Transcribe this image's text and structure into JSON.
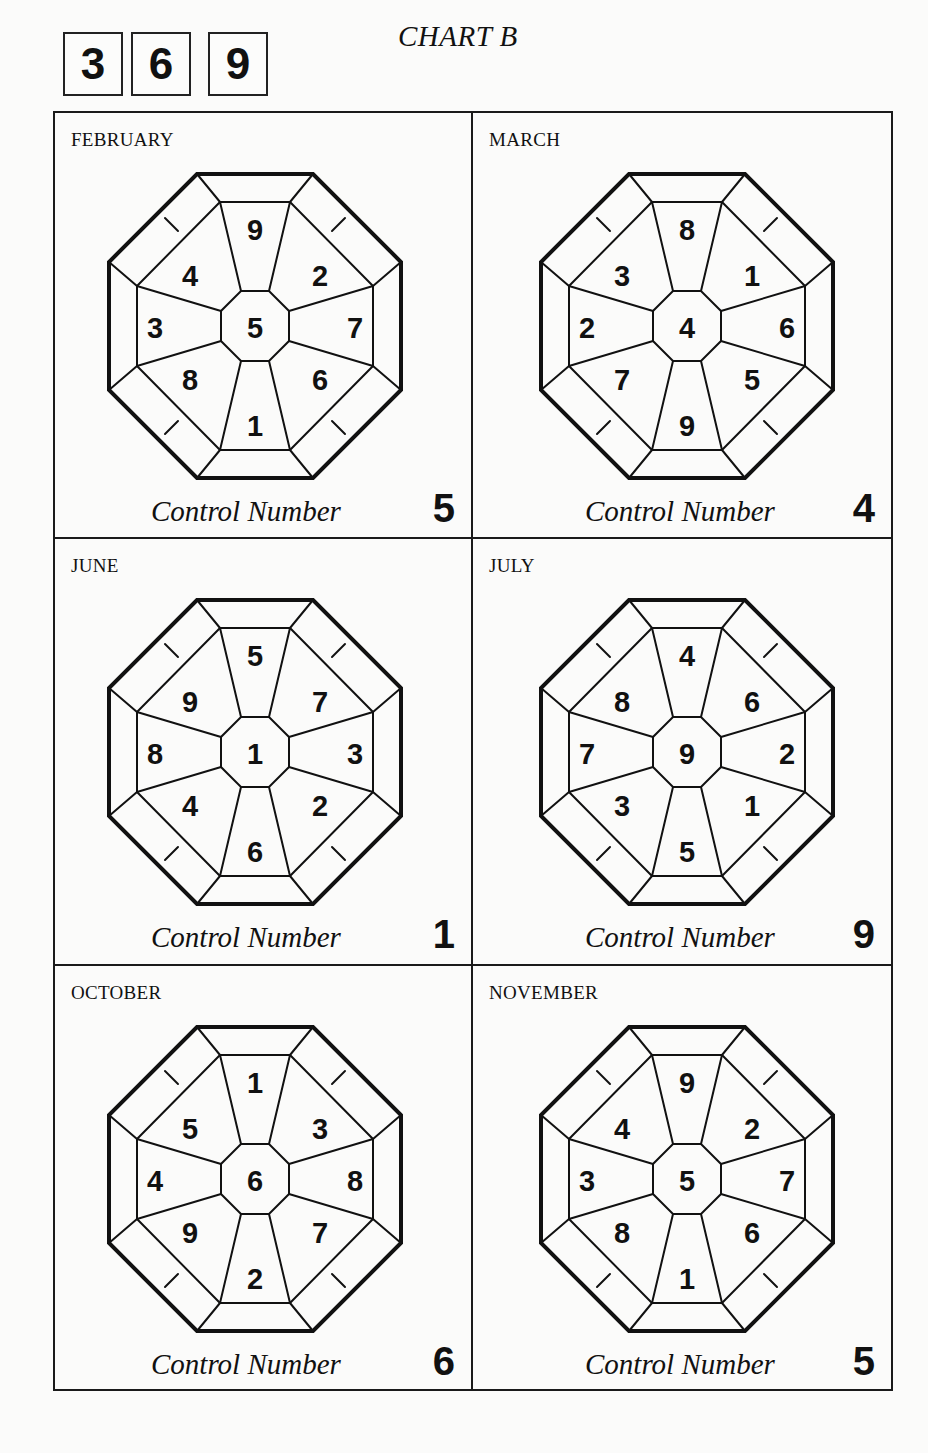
{
  "header": {
    "digits": [
      "3",
      "6",
      "9"
    ],
    "title": "CHART B"
  },
  "control_label": "Control Number",
  "charts": [
    {
      "month": "FEBRUARY",
      "center": "5",
      "top": "9",
      "top_right": "2",
      "right": "7",
      "bottom_right": "6",
      "bottom": "1",
      "bottom_left": "8",
      "left": "3",
      "top_left": "4",
      "control_number": "5"
    },
    {
      "month": "MARCH",
      "center": "4",
      "top": "8",
      "top_right": "1",
      "right": "6",
      "bottom_right": "5",
      "bottom": "9",
      "bottom_left": "7",
      "left": "2",
      "top_left": "3",
      "control_number": "4"
    },
    {
      "month": "JUNE",
      "center": "1",
      "top": "5",
      "top_right": "7",
      "right": "3",
      "bottom_right": "2",
      "bottom": "6",
      "bottom_left": "4",
      "left": "8",
      "top_left": "9",
      "control_number": "1"
    },
    {
      "month": "JULY",
      "center": "9",
      "top": "4",
      "top_right": "6",
      "right": "2",
      "bottom_right": "1",
      "bottom": "5",
      "bottom_left": "3",
      "left": "7",
      "top_left": "8",
      "control_number": "9"
    },
    {
      "month": "OCTOBER",
      "center": "6",
      "top": "1",
      "top_right": "3",
      "right": "8",
      "bottom_right": "7",
      "bottom": "2",
      "bottom_left": "9",
      "left": "4",
      "top_left": "5",
      "control_number": "6"
    },
    {
      "month": "NOVEMBER",
      "center": "5",
      "top": "9",
      "top_right": "2",
      "right": "7",
      "bottom_right": "6",
      "bottom": "1",
      "bottom_left": "8",
      "left": "3",
      "top_left": "4",
      "control_number": "5"
    }
  ],
  "colors": {
    "ink": "#111111",
    "paper": "#fbfbfa"
  }
}
